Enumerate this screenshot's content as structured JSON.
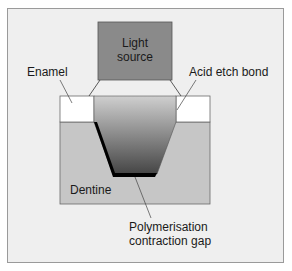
{
  "diagram": {
    "labels": {
      "light_source_line1": "Light",
      "light_source_line2": "source",
      "enamel": "Enamel",
      "acid_etch_bond": "Acid etch bond",
      "dentine": "Dentine",
      "gap_line1": "Polymerisation",
      "gap_line2": "contraction gap"
    },
    "colors": {
      "background": "#efefef",
      "frame_border": "#9a9a9a",
      "light_source": "#8a8a8a",
      "enamel": "#ffffff",
      "dentine": "#c6c6c6",
      "restoration_top": "#c8c8c8",
      "restoration_bottom": "#4a4a4a",
      "gap": "#000000"
    }
  }
}
